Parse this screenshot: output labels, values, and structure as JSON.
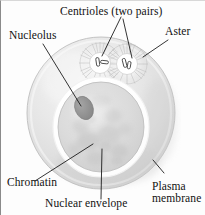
{
  "diagram": {
    "background_color": "#ffffff",
    "line_color": "#111111",
    "cell_color": "#e2e2e2",
    "nucleus_color": "#dcdcdc",
    "nucleolus_color": "#8f8f8f",
    "envelope_color": "#ffffff"
  },
  "labels": {
    "centrioles": "Centrioles (two pairs)",
    "aster": "Aster",
    "nucleolus": "Nucleolus",
    "chromatin": "Chromatin",
    "nuclear_envelope": "Nuclear envelope",
    "plasma_membrane_line1": "Plasma",
    "plasma_membrane_line2": "membrane"
  },
  "structures": {
    "cell": {
      "cx": 100,
      "cy": 112,
      "rx": 74,
      "ry": 76
    },
    "nucleus": {
      "cx": 100,
      "cy": 126,
      "rx": 43,
      "ry": 45
    },
    "nucleolus": {
      "cx": 83,
      "cy": 107,
      "rx": 9,
      "ry": 12
    },
    "centriole_left": {
      "cx": 99,
      "cy": 62,
      "r": 11
    },
    "centriole_right": {
      "cx": 126,
      "cy": 63,
      "r": 11
    }
  }
}
